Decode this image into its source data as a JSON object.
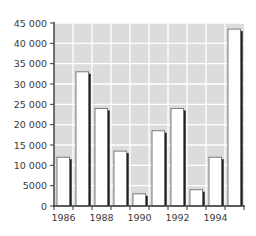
{
  "chart_data": {
    "type": "bar",
    "title": "",
    "xlabel": "",
    "ylabel": "",
    "categories": [
      "1986",
      "1987",
      "1988",
      "1989",
      "1990",
      "1991",
      "1992",
      "1993",
      "1994",
      "1995"
    ],
    "values": [
      12000,
      33000,
      24000,
      13500,
      3000,
      18500,
      24000,
      4000,
      12000,
      43500
    ],
    "x_tick_labels": [
      "1986",
      "1988",
      "1990",
      "1992",
      "1994"
    ],
    "y_tick_values": [
      0,
      5000,
      10000,
      15000,
      20000,
      25000,
      30000,
      35000,
      40000,
      45000
    ],
    "y_tick_labels": [
      "0",
      "5000",
      "10 000",
      "15 000",
      "20 000",
      "25 000",
      "30 000",
      "35 000",
      "40 000",
      "45 000"
    ],
    "ylim": [
      0,
      45000
    ],
    "grid": true,
    "legend": "none",
    "colors": {
      "plot_background": "#dcdcdc",
      "gridline": "#ffffff",
      "bar_fill": "#ffffff",
      "bar_outline": "#6e6e6e",
      "bar_shadow": "#1e1e1e",
      "axis": "#3a3a3a",
      "text": "#3a3a3a"
    }
  }
}
